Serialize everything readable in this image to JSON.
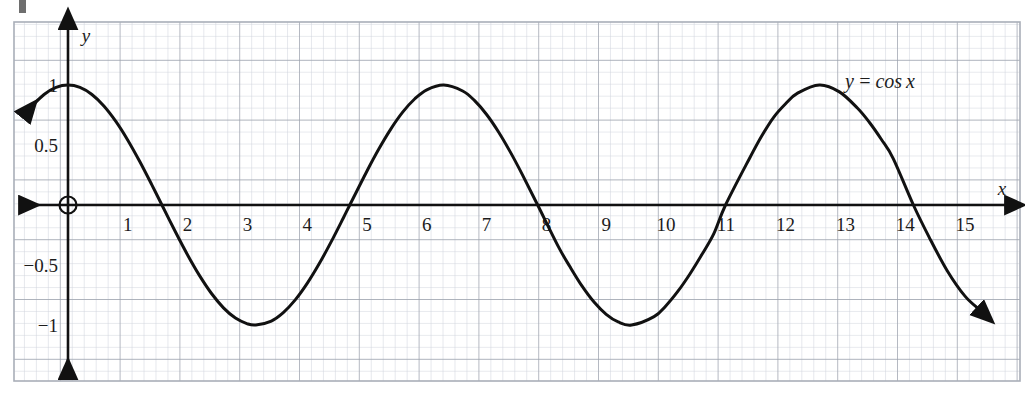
{
  "page": {
    "background_color": "#ffffff",
    "width": 1025,
    "height": 393
  },
  "marker": {
    "name": "page-edge-mark",
    "color": "#6e6e6e"
  },
  "grid": {
    "minor_color": "#cfd3dd",
    "major_color": "#9aa0ab",
    "border_color": "#a9aeb8",
    "minor_spacing_px": 11.96,
    "major_every": 5,
    "left": 14,
    "top": 22,
    "right": 1020,
    "bottom": 381
  },
  "axes": {
    "color": "#111111",
    "origin_px": {
      "x": 68,
      "y": 205
    },
    "x_unit_px": 59.8,
    "y_half_unit_px": 60,
    "x_label": "x",
    "y_label": "y",
    "origin_marker": "open-circle",
    "x_tick_labels": [
      "1",
      "2",
      "3",
      "4",
      "5",
      "6",
      "7",
      "8",
      "9",
      "10",
      "11",
      "12",
      "13",
      "14",
      "15"
    ],
    "y_tick_labels": [
      "1",
      "0.5",
      "−0.5",
      "−1"
    ]
  },
  "annotation": {
    "text": "y = cos x",
    "x": 880,
    "y": 88
  },
  "chart_data": {
    "type": "line",
    "title": "",
    "xlabel": "x",
    "ylabel": "y",
    "xlim": [
      -0.9,
      15.9
    ],
    "ylim": [
      -1.38,
      1.5
    ],
    "grid": true,
    "legend": null,
    "series": [
      {
        "name": "y = cos x",
        "equation": "y = cos(x)",
        "color": "#111111",
        "line_width": 3,
        "arrow_start": true,
        "arrow_end": true,
        "x_domain": [
          -0.72,
          15.25
        ],
        "key_points": [
          {
            "x": 0,
            "y": 1,
            "kind": "maximum"
          },
          {
            "x": 1.5708,
            "y": 0,
            "kind": "zero"
          },
          {
            "x": 3.1416,
            "y": -1,
            "kind": "minimum"
          },
          {
            "x": 4.7124,
            "y": 0,
            "kind": "zero"
          },
          {
            "x": 6.2832,
            "y": 1,
            "kind": "maximum"
          },
          {
            "x": 7.854,
            "y": 0,
            "kind": "zero"
          },
          {
            "x": 9.4248,
            "y": -1,
            "kind": "minimum"
          },
          {
            "x": 10.9956,
            "y": 0,
            "kind": "zero"
          },
          {
            "x": 12.5664,
            "y": 1,
            "kind": "maximum"
          },
          {
            "x": 14.1372,
            "y": 0,
            "kind": "zero"
          },
          {
            "x": 15.25,
            "y": -0.7,
            "kind": "endpoint"
          }
        ],
        "x": [
          -0.72,
          -0.6,
          -0.4,
          -0.2,
          0,
          0.2,
          0.4,
          0.6,
          0.8,
          1,
          1.2,
          1.4,
          1.5708,
          1.8,
          2,
          2.2,
          2.4,
          2.6,
          2.8,
          3,
          3.1416,
          3.4,
          3.6,
          3.8,
          4,
          4.2,
          4.4,
          4.6,
          4.7124,
          5,
          5.2,
          5.4,
          5.6,
          5.8,
          6,
          6.2832,
          6.6,
          6.8,
          7,
          7.2,
          7.4,
          7.6,
          7.854,
          8.2,
          8.4,
          8.6,
          8.8,
          9,
          9.2,
          9.4248,
          9.8,
          10,
          10.2,
          10.4,
          10.6,
          10.8,
          10.9956,
          11.4,
          11.6,
          11.8,
          12,
          12.2,
          12.5664,
          12.9,
          13.2,
          13.4,
          13.6,
          13.8,
          14.1372,
          14.4,
          14.7,
          15,
          15.25
        ],
        "y": [
          0.7518,
          0.8253,
          0.9211,
          0.9801,
          1,
          0.9801,
          0.9211,
          0.8253,
          0.6967,
          0.5403,
          0.3624,
          0.17,
          0,
          -0.2272,
          -0.4161,
          -0.5885,
          -0.7374,
          -0.8569,
          -0.9422,
          -0.99,
          -1,
          -0.9668,
          -0.8968,
          -0.791,
          -0.6536,
          -0.4903,
          -0.3073,
          -0.1122,
          0,
          0.2837,
          0.4685,
          0.6347,
          0.7756,
          0.8855,
          0.9602,
          1,
          0.9502,
          0.8694,
          0.7539,
          0.6084,
          0.4385,
          0.2513,
          0,
          -0.3466,
          -0.5193,
          -0.6787,
          -0.8111,
          -0.9111,
          -0.9748,
          -1,
          -0.9304,
          -0.8391,
          -0.7185,
          -0.5748,
          -0.4131,
          -0.2392,
          0,
          0.3919,
          0.5748,
          0.731,
          0.8439,
          0.9318,
          1,
          0.9428,
          0.808,
          0.6895,
          0.5477,
          0.3872,
          0,
          -0.2675,
          -0.5453,
          -0.7597,
          -0.8756
        ]
      }
    ]
  }
}
